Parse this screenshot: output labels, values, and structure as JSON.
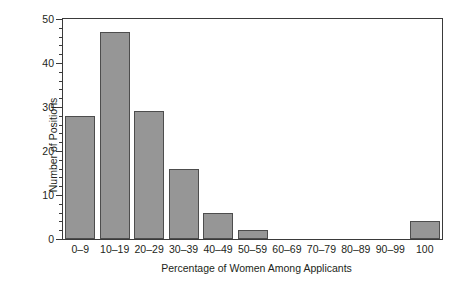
{
  "chart_data": {
    "type": "bar",
    "title": "",
    "subtitle": "",
    "xlabel": "Percentage of Women Among Applicants",
    "ylabel": "Number of Positions",
    "categories": [
      "0–9",
      "10–19",
      "20–29",
      "30–39",
      "40–49",
      "50–59",
      "60–69",
      "70–79",
      "80–89",
      "90–99",
      "100"
    ],
    "values": [
      28,
      47,
      29,
      16,
      6,
      2,
      0,
      0,
      0,
      0,
      4
    ],
    "ylim": [
      0,
      50
    ],
    "y_major_ticks": [
      0,
      10,
      20,
      30,
      40,
      50
    ],
    "y_tick_labels": [
      "0",
      "10",
      "20",
      "30",
      "40",
      "50"
    ],
    "y_minor_tick_step": 2,
    "grid": false,
    "legend": false,
    "legend_position": "none",
    "bar_fill_color": "#969696",
    "bar_edge_color": "#4d4d4d",
    "frame_color": "#3a3a3a",
    "background_color": "#ffffff"
  }
}
